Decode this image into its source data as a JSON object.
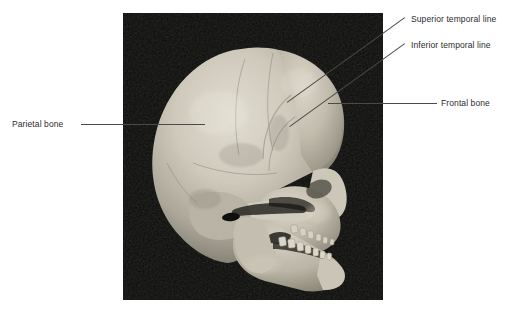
{
  "figure": {
    "background_color": "#ffffff",
    "text_color": "#2b2b2b",
    "leader_color": "#4a4a4a"
  },
  "photo": {
    "name": "skull-photograph",
    "x": 123,
    "y": 13,
    "width": 260,
    "height": 287,
    "background_color": "#0a0a0a",
    "bone_color": "#c9c5b8",
    "bone_shadow_color": "#8d897e"
  },
  "labels": [
    {
      "id": "parietal-bone",
      "text": "Parietal bone",
      "x": 12,
      "y": 119,
      "leader": {
        "type": "horizontal",
        "x1": 81,
        "y1": 124,
        "x2": 205,
        "y2": 124
      }
    },
    {
      "id": "superior-temporal-line",
      "text": "Superior temporal line",
      "x": 411,
      "y": 14,
      "leader": {
        "type": "diagonal",
        "x1": 405,
        "y1": 18,
        "x2": 287,
        "y2": 103
      }
    },
    {
      "id": "inferior-temporal-line",
      "text": "Inferior temporal line",
      "x": 411,
      "y": 40,
      "leader": {
        "type": "diagonal",
        "x1": 405,
        "y1": 44,
        "x2": 290,
        "y2": 127
      }
    },
    {
      "id": "frontal-bone",
      "text": "Frontal bone",
      "x": 441,
      "y": 98,
      "leader": {
        "type": "horizontal",
        "x1": 328,
        "y1": 103,
        "x2": 437,
        "y2": 103
      }
    }
  ]
}
